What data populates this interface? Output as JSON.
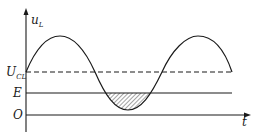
{
  "diagram": {
    "type": "waveform",
    "labels": {
      "y_axis": "u",
      "y_axis_sub": "L",
      "x_axis": "t",
      "ucl_main": "U",
      "ucl_sub": "CL",
      "e_level": "E",
      "origin": "O"
    },
    "levels": [
      {
        "name": "U_CL",
        "style": "dashed"
      },
      {
        "name": "E",
        "style": "solid"
      },
      {
        "name": "O",
        "style": "axis"
      }
    ],
    "curve": "sinusoid centered on U_CL, trough dips below E",
    "shaded_region": "area between E line and curve where curve is below E (hatched)",
    "colors": {
      "stroke": "#1a1a1a",
      "background": "#ffffff"
    }
  }
}
